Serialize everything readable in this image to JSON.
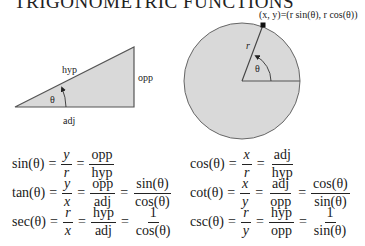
{
  "title": "TRIGONOMETRIC FUNCTIONS",
  "triangle": {
    "labels": {
      "hyp": "hyp",
      "opp": "opp",
      "adj": "adj",
      "angle": "θ"
    },
    "fill": "#d9d9d9",
    "stroke": "#555555"
  },
  "circle": {
    "point_label": "(x, y)=(r sin(θ), r cos(θ))",
    "radius_label": "r",
    "angle_label": "θ",
    "fill": "#d9d9d9",
    "stroke": "#666666"
  },
  "formulas": [
    {
      "lhs": "sin(θ)",
      "f1": {
        "num": "y",
        "den": "r",
        "italic": true
      },
      "f2": {
        "num": "opp",
        "den": "hyp"
      },
      "f3": null
    },
    {
      "lhs": "cos(θ)",
      "f1": {
        "num": "x",
        "den": "r",
        "italic": true
      },
      "f2": {
        "num": "adj",
        "den": "hyp"
      },
      "f3": null
    },
    {
      "lhs": "tan(θ)",
      "f1": {
        "num": "y",
        "den": "x",
        "italic": true
      },
      "f2": {
        "num": "opp",
        "den": "adj"
      },
      "f3": {
        "num": "sin(θ)",
        "den": "cos(θ)"
      }
    },
    {
      "lhs": "cot(θ)",
      "f1": {
        "num": "x",
        "den": "y",
        "italic": true
      },
      "f2": {
        "num": "adj",
        "den": "opp"
      },
      "f3": {
        "num": "cos(θ)",
        "den": "sin(θ)"
      }
    },
    {
      "lhs": "sec(θ)",
      "f1": {
        "num": "r",
        "den": "x",
        "italic": true
      },
      "f2": {
        "num": "hyp",
        "den": "adj"
      },
      "f3": {
        "num": "1",
        "den": "cos(θ)"
      }
    },
    {
      "lhs": "csc(θ)",
      "f1": {
        "num": "r",
        "den": "y",
        "italic": true
      },
      "f2": {
        "num": "hyp",
        "den": "opp"
      },
      "f3": {
        "num": "1",
        "den": "sin(θ)"
      }
    }
  ],
  "equals": "="
}
